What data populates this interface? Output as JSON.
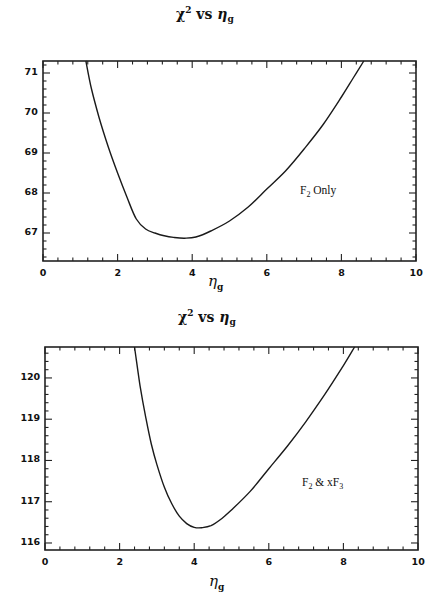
{
  "chart_data": [
    {
      "type": "line",
      "title": "χ² vs η_g",
      "title_parts": {
        "chi": "χ",
        "sup": "2",
        "vs": "vs",
        "eta": "η",
        "sub": "g"
      },
      "xlabel": "η_g",
      "xlabel_parts": {
        "eta": "η",
        "sub": "g"
      },
      "ylabel": "",
      "xlim": [
        0,
        10
      ],
      "ylim": [
        66.3,
        71.3
      ],
      "xticks": [
        "0",
        "2",
        "4",
        "6",
        "8",
        "10"
      ],
      "yticks": [
        "67",
        "68",
        "69",
        "70",
        "71"
      ],
      "grid": false,
      "annotation": {
        "text": "F₂ Only",
        "base": "F",
        "sub": "2",
        "rest": "Only",
        "x": 7.7,
        "y": 68.0
      },
      "series": [
        {
          "name": "F2 Only",
          "x": [
            1.15,
            1.3,
            1.5,
            1.75,
            2.0,
            2.25,
            2.5,
            2.75,
            3.0,
            3.25,
            3.5,
            3.8,
            4.1,
            4.5,
            5.0,
            5.5,
            6.0,
            6.5,
            7.0,
            7.5,
            8.0,
            8.3,
            8.6
          ],
          "y": [
            71.3,
            70.6,
            69.9,
            69.15,
            68.5,
            67.9,
            67.35,
            67.1,
            67.0,
            66.93,
            66.89,
            66.87,
            66.9,
            67.05,
            67.3,
            67.65,
            68.1,
            68.55,
            69.1,
            69.7,
            70.4,
            70.85,
            71.3
          ]
        }
      ]
    },
    {
      "type": "line",
      "title": "χ² vs η_g",
      "title_parts": {
        "chi": "χ",
        "sup": "2",
        "vs": "vs",
        "eta": "η",
        "sub": "g"
      },
      "xlabel": "η_g",
      "xlabel_parts": {
        "eta": "η",
        "sub": "g"
      },
      "ylabel": "",
      "xlim": [
        0,
        10
      ],
      "ylim": [
        115.83,
        120.75
      ],
      "xticks": [
        "0",
        "2",
        "4",
        "6",
        "8",
        "10"
      ],
      "yticks": [
        "116",
        "117",
        "118",
        "119",
        "120"
      ],
      "grid": false,
      "annotation": {
        "text": "F₂ & xF₃",
        "base": "F",
        "sub": "2",
        "mid": "& xF",
        "sub2": "3",
        "x": 7.7,
        "y": 117.5
      },
      "series": [
        {
          "name": "F2 & xF3",
          "x": [
            2.4,
            2.55,
            2.7,
            2.85,
            3.0,
            3.2,
            3.4,
            3.6,
            3.8,
            4.0,
            4.2,
            4.45,
            4.75,
            5.0,
            5.5,
            6.0,
            6.5,
            7.0,
            7.5,
            8.0,
            8.3
          ],
          "y": [
            120.75,
            119.8,
            119.05,
            118.4,
            117.9,
            117.35,
            116.95,
            116.65,
            116.47,
            116.38,
            116.37,
            116.42,
            116.6,
            116.8,
            117.25,
            117.8,
            118.35,
            118.95,
            119.6,
            120.3,
            120.75
          ]
        }
      ]
    }
  ]
}
